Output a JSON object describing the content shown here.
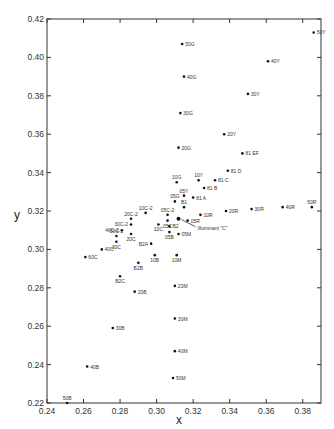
{
  "chart_data": {
    "type": "scatter",
    "title": "",
    "xlabel": "x",
    "ylabel": "y",
    "xlim": [
      0.24,
      0.39
    ],
    "ylim": [
      0.22,
      0.42
    ],
    "xticks": [
      "0.24",
      "0.26",
      "0.28",
      "0.30",
      "0.32",
      "0.34",
      "0.36",
      "0.38"
    ],
    "yticks": [
      "0.22",
      "0.24",
      "0.26",
      "0.28",
      "0.30",
      "0.32",
      "0.34",
      "0.36",
      "0.38",
      "0.40",
      "0.42"
    ],
    "grid": false,
    "legend": null,
    "annotations": [
      {
        "text": "Illuminant \"C\"",
        "x": 0.312,
        "y": 0.316,
        "arrow": true
      }
    ],
    "points": [
      {
        "label": "50Y",
        "x": 0.386,
        "y": 0.413
      },
      {
        "label": "40Y",
        "x": 0.361,
        "y": 0.398
      },
      {
        "label": "30Y",
        "x": 0.35,
        "y": 0.381
      },
      {
        "label": "20Y",
        "x": 0.337,
        "y": 0.36
      },
      {
        "label": "10Y",
        "x": 0.323,
        "y": 0.336
      },
      {
        "label": "05Y",
        "x": 0.315,
        "y": 0.328
      },
      {
        "label": "81 EF",
        "x": 0.347,
        "y": 0.35
      },
      {
        "label": "81 D",
        "x": 0.339,
        "y": 0.341
      },
      {
        "label": "81 C",
        "x": 0.332,
        "y": 0.336
      },
      {
        "label": "81 B",
        "x": 0.326,
        "y": 0.332
      },
      {
        "label": "81 A",
        "x": 0.32,
        "y": 0.327
      },
      {
        "label": "50G",
        "x": 0.314,
        "y": 0.407
      },
      {
        "label": "40G",
        "x": 0.315,
        "y": 0.39
      },
      {
        "label": "30G",
        "x": 0.313,
        "y": 0.371
      },
      {
        "label": "20G",
        "x": 0.312,
        "y": 0.353
      },
      {
        "label": "10G",
        "x": 0.311,
        "y": 0.335
      },
      {
        "label": "05G",
        "x": 0.31,
        "y": 0.325
      },
      {
        "label": "B1",
        "x": 0.315,
        "y": 0.322
      },
      {
        "label": "10R",
        "x": 0.324,
        "y": 0.318
      },
      {
        "label": "20R",
        "x": 0.338,
        "y": 0.32
      },
      {
        "label": "30R",
        "x": 0.352,
        "y": 0.321
      },
      {
        "label": "40R",
        "x": 0.369,
        "y": 0.322
      },
      {
        "label": "50R",
        "x": 0.385,
        "y": 0.322
      },
      {
        "label": "05R",
        "x": 0.317,
        "y": 0.315
      },
      {
        "label": "05C-2",
        "x": 0.306,
        "y": 0.318
      },
      {
        "label": "10C-2",
        "x": 0.294,
        "y": 0.319
      },
      {
        "label": "05C",
        "x": 0.306,
        "y": 0.315
      },
      {
        "label": "10C",
        "x": 0.301,
        "y": 0.313
      },
      {
        "label": "B2",
        "x": 0.307,
        "y": 0.312
      },
      {
        "label": "05B",
        "x": 0.307,
        "y": 0.309
      },
      {
        "label": "05M",
        "x": 0.312,
        "y": 0.308
      },
      {
        "label": "20C-2",
        "x": 0.286,
        "y": 0.316
      },
      {
        "label": "30C-2",
        "x": 0.286,
        "y": 0.313
      },
      {
        "label": "40C-2",
        "x": 0.281,
        "y": 0.31
      },
      {
        "label": "20C",
        "x": 0.286,
        "y": 0.308
      },
      {
        "label": "50C-2",
        "x": 0.278,
        "y": 0.307
      },
      {
        "label": "30C",
        "x": 0.278,
        "y": 0.304
      },
      {
        "label": "40C",
        "x": 0.27,
        "y": 0.3
      },
      {
        "label": "60C",
        "x": 0.261,
        "y": 0.296
      },
      {
        "label": "B2A",
        "x": 0.297,
        "y": 0.303
      },
      {
        "label": "10B",
        "x": 0.299,
        "y": 0.297
      },
      {
        "label": "10M",
        "x": 0.311,
        "y": 0.297
      },
      {
        "label": "B2B",
        "x": 0.29,
        "y": 0.293
      },
      {
        "label": "B2C",
        "x": 0.28,
        "y": 0.286
      },
      {
        "label": "20B",
        "x": 0.288,
        "y": 0.278
      },
      {
        "label": "20M",
        "x": 0.31,
        "y": 0.281
      },
      {
        "label": "30M",
        "x": 0.31,
        "y": 0.264
      },
      {
        "label": "30B",
        "x": 0.276,
        "y": 0.259
      },
      {
        "label": "40M",
        "x": 0.31,
        "y": 0.247
      },
      {
        "label": "40B",
        "x": 0.262,
        "y": 0.239
      },
      {
        "label": "50M",
        "x": 0.309,
        "y": 0.233
      },
      {
        "label": "50B",
        "x": 0.251,
        "y": 0.22
      }
    ],
    "label_placement": {
      "50Y": "right",
      "40Y": "right",
      "30Y": "right",
      "20Y": "right",
      "10Y": "above",
      "05Y": "above",
      "81 EF": "right",
      "81 D": "right",
      "81 C": "right",
      "81 B": "right",
      "81 A": "right",
      "50G": "right",
      "40G": "right",
      "30G": "right",
      "20G": "right",
      "10G": "above",
      "05G": "above",
      "B1": "above",
      "10R": "right",
      "20R": "right",
      "30R": "right",
      "40R": "right",
      "50R": "above",
      "05R": "right",
      "05C-2": "above",
      "10C-2": "above",
      "05C": "below",
      "10C": "below",
      "B2": "right",
      "05B": "below",
      "05M": "right",
      "20C-2": "above",
      "30C-2": "left",
      "40C-2": "left",
      "20C": "below",
      "50C-2": "above",
      "30C": "below",
      "40C": "right",
      "60C": "right",
      "B2A": "left",
      "10B": "below",
      "10M": "below",
      "B2B": "below",
      "B2C": "below",
      "20B": "right",
      "20M": "right",
      "30M": "right",
      "30B": "right",
      "40M": "right",
      "40B": "right",
      "50M": "right",
      "50B": "above"
    }
  },
  "axes": {
    "x_title": "x",
    "y_title": "y"
  }
}
